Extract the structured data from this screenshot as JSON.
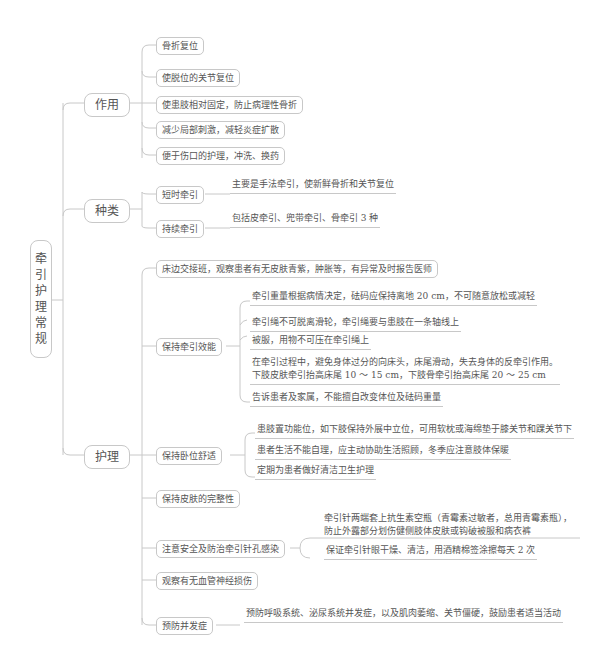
{
  "root": {
    "label": "牵引护理常规",
    "chars": [
      "牵",
      "引",
      "护",
      "理",
      "常",
      "规"
    ]
  },
  "branches": {
    "zuoyong": {
      "label": "作用",
      "items": [
        "骨折复位",
        "使脱位的关节复位",
        "使患肢相对固定，防止病理性骨折",
        "减少局部刺激，减轻炎症扩散",
        "便于伤口的护理，冲洗、换药"
      ]
    },
    "zhonglei": {
      "label": "种类",
      "items": [
        {
          "label": "短时牵引",
          "detail": "主要是手法牵引，使新鲜骨折和关节复位"
        },
        {
          "label": "持续牵引",
          "detail": "包括皮牵引、兜带牵引、骨牵引 3 种"
        }
      ]
    },
    "huli": {
      "label": "护理",
      "items": [
        {
          "label": "床边交接班，观察患者有无皮肤青紫，肿胀等，有异常及时报告医师"
        },
        {
          "label": "保持牵引效能",
          "details": [
            "牵引重量根据病情决定，砝码应保持离地 20 cm，不可随意放松或减轻",
            "牵引绳不可脱离滑轮，牵引绳要与患肢在一条轴线上",
            "被服，用物不可压在牵引绳上",
            "在牵引过程中，避免身体过分的向床头，床尾滑动，失去身体的反牵引作用。",
            "下肢皮肤牵引抬高床尾 10 ～ 15 cm，下肢骨牵引抬高床尾 20 ～ 25 cm",
            "告诉患者及家属，不能擅自改变体位及砝码重量"
          ]
        },
        {
          "label": "保持卧位舒适",
          "details": [
            "患肢置功能位，如下肢保持外展中立位，可用软枕或海绵垫于膝关节和踝关节下",
            "患者生活不能自理，应主动协助生活照顾，冬季应注意肢体保暖",
            "定期为患者做好清洁卫生护理"
          ]
        },
        {
          "label": "保持皮肤的完整性"
        },
        {
          "label": "注意安全及防治牵引针孔感染",
          "details": [
            "牵引针两端套上抗生素空瓶（青霉素过敏者，总用青霉素瓶），",
            "防止外露部分划伤健侧肢体皮肤或钩破被服和病衣裤",
            "保证牵引针眼干燥、清洁，用酒精棉签涂擦每天 2 次"
          ]
        },
        {
          "label": "观察有无血管神经损伤"
        },
        {
          "label": "预防并发症",
          "details": [
            "预防呼吸系统、泌尿系统并发症，以及肌肉萎缩、关节僵硬，鼓励患者适当活动"
          ]
        }
      ]
    }
  },
  "colors": {
    "line": "#c8c8c8",
    "text": "#555555",
    "background": "#ffffff"
  }
}
